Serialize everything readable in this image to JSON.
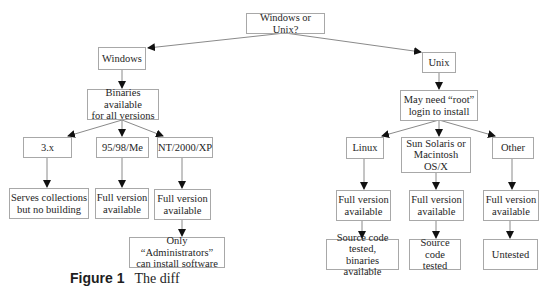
{
  "nodes": {
    "root": "Windows or Unix?",
    "windows": "Windows",
    "binaries": "Binaries available\nfor all versions",
    "win3x": "3.x",
    "win9x": "95/98/Me",
    "winnt": "NT/2000/XP",
    "serves": "Serves collections\nbut no building",
    "full_9x": "Full version\navailable",
    "full_nt": "Full version\navailable",
    "admins": "Only “Administrators”\ncan install software",
    "unix": "Unix",
    "root_login": "May need “root”\nlogin to install",
    "linux": "Linux",
    "sun": "Sun Solaris or\nMacintosh OS/X",
    "other": "Other",
    "full_linux": "Full version\navailable",
    "full_sun": "Full version\navailable",
    "full_other": "Full version\navailable",
    "src_bin": "Source code tested,\nbinaries available",
    "src_tested": "Source code\ntested",
    "untested": "Untested"
  },
  "caption": {
    "label": "Figure 1",
    "text": "The diff"
  },
  "colors": {
    "border": "#a8a8a8",
    "edge": "#8a8a8a",
    "arrow": "#111111"
  }
}
